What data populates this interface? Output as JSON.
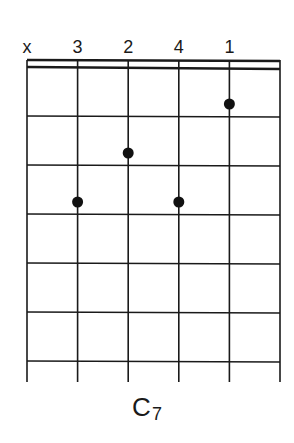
{
  "chord": {
    "name": "C",
    "suffix": "7",
    "strings": 6,
    "frets_shown": 6,
    "top_markers": [
      "x",
      "3",
      "2",
      "4",
      "1",
      ""
    ],
    "dots": [
      {
        "string": 2,
        "fret": 3,
        "finger": "3"
      },
      {
        "string": 3,
        "fret": 2,
        "finger": "2"
      },
      {
        "string": 4,
        "fret": 3,
        "finger": "4"
      },
      {
        "string": 5,
        "fret": 1,
        "finger": "1"
      }
    ],
    "muted_strings": [
      1
    ],
    "colors": {
      "line": "#1a1a1a",
      "dot": "#111111",
      "background": "#ffffff"
    }
  }
}
